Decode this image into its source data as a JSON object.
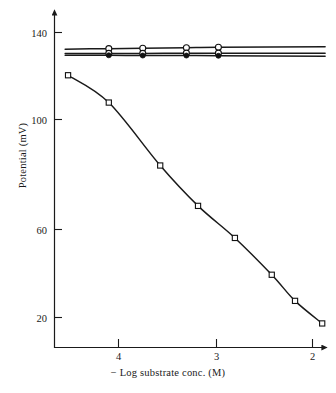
{
  "chart_data": {
    "type": "line",
    "title": "",
    "xlabel": "− Log substrate conc. (M)",
    "ylabel": "Potential (mV)",
    "xlim": [
      4.55,
      1.87
    ],
    "ylim": [
      5,
      148
    ],
    "x_ticks": [
      4,
      3,
      2
    ],
    "x_tick_labels": [
      "4",
      "3",
      "2"
    ],
    "y_ticks": [
      140,
      100,
      60,
      20
    ],
    "y_tick_labels": [
      "140",
      "100",
      "60",
      "20"
    ],
    "grid": false,
    "legend": "none",
    "axis_arrows": true,
    "series": [
      {
        "name": "upper flat response",
        "marker": "open-circle",
        "x": [
          4.55,
          4.1,
          3.75,
          3.3,
          2.97,
          1.87
        ],
        "y": [
          133.0,
          133.2,
          133.4,
          133.6,
          133.8,
          134.0
        ]
      },
      {
        "name": "middle flat response",
        "marker": "open-circle",
        "x": [
          4.55,
          4.1,
          3.75,
          3.3,
          2.97,
          1.87
        ],
        "y": [
          131.2,
          131.2,
          131.2,
          131.3,
          131.3,
          131.3
        ]
      },
      {
        "name": "lower flat response",
        "marker": "filled-circle",
        "x": [
          4.55,
          4.1,
          3.75,
          3.3,
          2.97,
          1.87
        ],
        "y": [
          130.4,
          130.4,
          130.3,
          130.3,
          130.2,
          130.0
        ]
      },
      {
        "name": "substrate response curve",
        "marker": "open-square",
        "x": [
          4.52,
          4.1,
          3.57,
          3.18,
          2.8,
          2.42,
          2.18,
          1.9
        ],
        "y": [
          122.0,
          110.5,
          84.0,
          67.0,
          53.5,
          38.0,
          27.0,
          17.5
        ]
      }
    ]
  },
  "figure": {
    "x_axis_label": "− Log substrate conc. (M)",
    "y_axis_label": "Potential (mV)",
    "caption_fragment": ""
  }
}
